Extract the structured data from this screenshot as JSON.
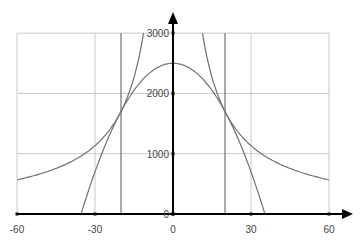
{
  "chart_data": {
    "type": "line",
    "title": "",
    "xlabel": "",
    "ylabel": "",
    "xlim": [
      -60,
      60
    ],
    "ylim": [
      0,
      3000
    ],
    "grid": true,
    "x_ticks": [
      -60,
      -30,
      0,
      30,
      60
    ],
    "x_tick_labels": [
      "-60",
      "-30",
      "0",
      "30",
      "60"
    ],
    "y_ticks": [
      0,
      1000,
      2000,
      3000
    ],
    "y_tick_labels": [
      "0",
      "1000",
      "2000",
      "3000"
    ],
    "legend": null,
    "series": [
      {
        "name": "hyperbola",
        "formula": "y = 34000 / |x|",
        "points": [
          [
            -60,
            567
          ],
          [
            -50,
            680
          ],
          [
            -40,
            850
          ],
          [
            -30,
            1133
          ],
          [
            -20,
            1700
          ],
          [
            -15,
            2267
          ],
          [
            -11.3,
            3000
          ],
          [
            11.3,
            3000
          ],
          [
            15,
            2267
          ],
          [
            20,
            1700
          ],
          [
            30,
            1133
          ],
          [
            40,
            850
          ],
          [
            50,
            680
          ],
          [
            60,
            567
          ]
        ]
      },
      {
        "name": "parabola",
        "formula": "y = 2500 - 2x^2",
        "points": [
          [
            -35.4,
            0
          ],
          [
            -30,
            700
          ],
          [
            -20,
            1700
          ],
          [
            -10,
            2300
          ],
          [
            0,
            2500
          ],
          [
            10,
            2300
          ],
          [
            20,
            1700
          ],
          [
            30,
            700
          ],
          [
            35.4,
            0
          ]
        ]
      },
      {
        "name": "vertical-line-left",
        "points": [
          [
            -20,
            0
          ],
          [
            -20,
            3000
          ]
        ]
      },
      {
        "name": "vertical-line-right",
        "points": [
          [
            20,
            0
          ],
          [
            20,
            3000
          ]
        ]
      }
    ]
  },
  "colors": {
    "grid": "#c8c8c8",
    "curve": "#707070",
    "axis": "#000000",
    "label": "#444444"
  }
}
